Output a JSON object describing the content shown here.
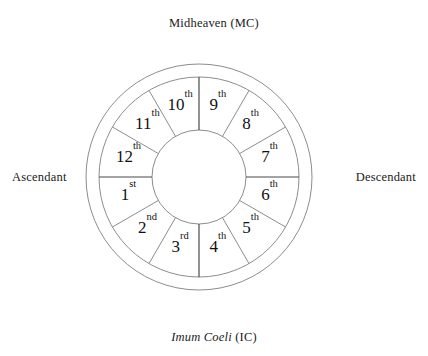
{
  "figure": {
    "name": "astrological-house-wheel",
    "geometry": {
      "center_x": 199,
      "center_y": 177,
      "outer_radius": 113,
      "middle_radius": 100,
      "inner_radius": 47,
      "sector_count": 12,
      "sector_degrees": 30
    },
    "colors": {
      "background": "#ffffff",
      "ring_stroke": "#8d8d8d",
      "axis_stroke": "#4a4a4a",
      "text": "#111111"
    }
  },
  "cardinal_points": {
    "top": {
      "name": "midheaven",
      "text": "Midheaven (MC)",
      "term": "Midheaven",
      "abbr": "(MC)",
      "italic": false
    },
    "bottom": {
      "name": "imum-coeli",
      "text": "Imum Coeli (IC)",
      "term": "Imum Coeli",
      "abbr": "(IC)",
      "italic": true
    },
    "left": {
      "name": "ascendant",
      "text": "Ascendant",
      "term": "Ascendant",
      "abbr": "",
      "italic": false
    },
    "right": {
      "name": "descendant",
      "text": "Descendant",
      "term": "Descendant",
      "abbr": "",
      "italic": false
    }
  },
  "houses": [
    {
      "number": "1",
      "ordinal": "st",
      "label": "1st",
      "angle_deg": 195,
      "label_radius": 73
    },
    {
      "number": "2",
      "ordinal": "nd",
      "label": "2nd",
      "angle_deg": 225,
      "label_radius": 73
    },
    {
      "number": "3",
      "ordinal": "rd",
      "label": "3rd",
      "angle_deg": 255,
      "label_radius": 73
    },
    {
      "number": "4",
      "ordinal": "th",
      "label": "4th",
      "angle_deg": 285,
      "label_radius": 73
    },
    {
      "number": "5",
      "ordinal": "th",
      "label": "5th",
      "angle_deg": 315,
      "label_radius": 73
    },
    {
      "number": "6",
      "ordinal": "th",
      "label": "6th",
      "angle_deg": 345,
      "label_radius": 73
    },
    {
      "number": "7",
      "ordinal": "th",
      "label": "7th",
      "angle_deg": 15,
      "label_radius": 73
    },
    {
      "number": "8",
      "ordinal": "th",
      "label": "8th",
      "angle_deg": 45,
      "label_radius": 73
    },
    {
      "number": "9",
      "ordinal": "th",
      "label": "9th",
      "angle_deg": 75,
      "label_radius": 73
    },
    {
      "number": "10",
      "ordinal": "th",
      "label": "10th",
      "angle_deg": 105,
      "label_radius": 73
    },
    {
      "number": "11",
      "ordinal": "th",
      "label": "11th",
      "angle_deg": 135,
      "label_radius": 73
    },
    {
      "number": "12",
      "ordinal": "th",
      "label": "12th",
      "angle_deg": 165,
      "label_radius": 73
    }
  ],
  "axes": [
    {
      "name": "mc-axis",
      "angle_deg": 90
    },
    {
      "name": "ic-axis",
      "angle_deg": 270
    },
    {
      "name": "asc-axis",
      "angle_deg": 180
    },
    {
      "name": "dsc-axis",
      "angle_deg": 0
    }
  ]
}
